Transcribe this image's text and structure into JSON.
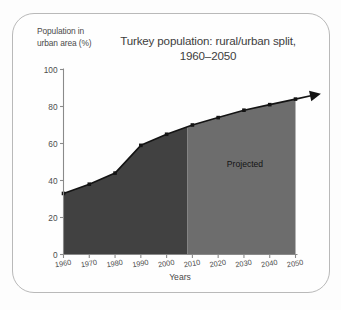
{
  "figure": {
    "title_line1": "Turkey population: rural/urban split,",
    "title_line2": "1960–2050",
    "y_axis_caption_line1": "Population in",
    "y_axis_caption_line2": "urban area (%)",
    "x_axis_label": "Years",
    "projected_label": "Projected",
    "frame_border_color": "#b9b9b9",
    "background_color": "#fefefe",
    "actual_fill_color": "#414141",
    "projected_fill_color": "#6d6d6d",
    "line_color": "#141414",
    "axis_color": "#8a8a8a"
  },
  "chart_data": {
    "type": "area",
    "title": "Turkey population: rural/urban split, 1960–2050",
    "xlabel": "Years",
    "ylabel": "Population in urban area (%)",
    "xlim": [
      1960,
      2050
    ],
    "ylim": [
      0,
      100
    ],
    "grid": false,
    "legend_position": "none",
    "x": [
      1960,
      1970,
      1980,
      1990,
      2000,
      2010,
      2020,
      2030,
      2040,
      2050
    ],
    "xticks": [
      "1960",
      "1970",
      "1980",
      "1990",
      "2000",
      "2010",
      "2020",
      "2030",
      "2040",
      "2050"
    ],
    "yticks": [
      "0",
      "20",
      "40",
      "60",
      "80",
      "100"
    ],
    "ytick_values": [
      0,
      20,
      40,
      60,
      80,
      100
    ],
    "series": [
      {
        "name": "Urban population share (%)",
        "values": [
          33,
          38,
          44,
          59,
          65,
          70,
          74,
          78,
          81,
          84
        ]
      }
    ],
    "annotations": [
      {
        "text": "Projected",
        "x": 2030,
        "y": 35
      }
    ],
    "regions": [
      {
        "label": "Actual",
        "x_from": 1960,
        "x_to": 2008,
        "fill": "#414141"
      },
      {
        "label": "Projected",
        "x_from": 2008,
        "x_to": 2050,
        "fill": "#6d6d6d"
      }
    ],
    "markers": "square",
    "arrow_at_end": true
  }
}
